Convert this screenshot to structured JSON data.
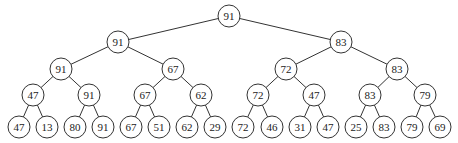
{
  "diagram": {
    "type": "binary-tree (max tournament tree)",
    "levels": [
      [
        "91"
      ],
      [
        "91",
        "83"
      ],
      [
        "91",
        "67",
        "72",
        "83"
      ],
      [
        "47",
        "91",
        "67",
        "62",
        "72",
        "47",
        "83",
        "79"
      ],
      [
        "47",
        "13",
        "80",
        "91",
        "67",
        "51",
        "62",
        "29",
        "72",
        "46",
        "31",
        "47",
        "25",
        "83",
        "79",
        "69"
      ]
    ]
  }
}
